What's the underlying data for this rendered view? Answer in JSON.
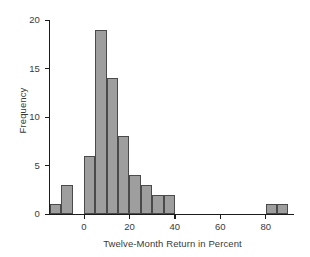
{
  "chart_data": {
    "type": "bar",
    "title": "",
    "subtitle": "",
    "xlabel": "Twelve-Month Return in Percent",
    "ylabel": "Frequency",
    "xlim": [
      -15,
      92
    ],
    "ylim": [
      0,
      20
    ],
    "xticks": [
      0,
      20,
      40,
      60,
      80
    ],
    "xtick_labels": [
      "0",
      "20",
      "40",
      "60",
      "80"
    ],
    "yticks": [
      0,
      5,
      10,
      15,
      20
    ],
    "ytick_labels": [
      "0",
      "5",
      "10",
      "15",
      "20"
    ],
    "grid": false,
    "legend": null,
    "bin_width": 5,
    "bin_edges": [
      -15,
      -10,
      -5,
      0,
      5,
      10,
      15,
      20,
      25,
      30,
      35,
      40,
      45,
      50,
      55,
      60,
      65,
      70,
      75,
      80,
      85,
      90
    ],
    "categories": [
      "-15 to -10",
      "-10 to -5",
      "-5 to 0",
      "0 to 5",
      "5 to 10",
      "10 to 15",
      "15 to 20",
      "20 to 25",
      "25 to 30",
      "30 to 35",
      "35 to 40",
      "40 to 45",
      "45 to 50",
      "50 to 55",
      "55 to 60",
      "60 to 65",
      "65 to 70",
      "70 to 75",
      "75 to 80",
      "80 to 85",
      "85 to 90"
    ],
    "values": [
      1,
      3,
      0,
      6,
      19,
      14,
      8,
      4,
      3,
      2,
      2,
      0,
      0,
      0,
      0,
      0,
      0,
      0,
      0,
      1,
      1
    ],
    "bar_color": "#9e9e9e",
    "bar_edge_color": "#4a4a4a",
    "axis_color": "#1b1b1b"
  },
  "axes": {
    "ylabel": "Frequency",
    "xlabel": "Twelve-Month Return in Percent"
  }
}
